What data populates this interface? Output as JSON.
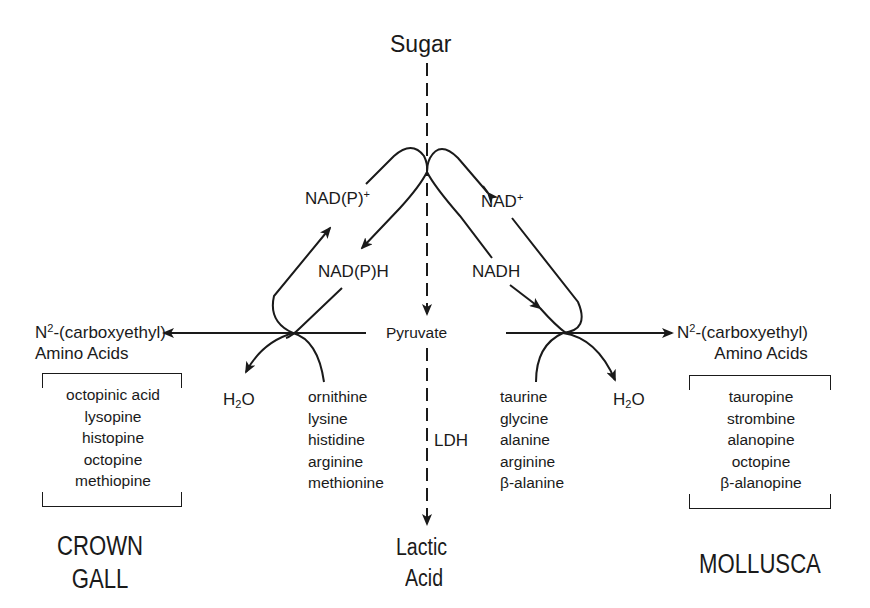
{
  "diagram": {
    "title_nodes": {
      "sugar": "Sugar",
      "pyruvate": "Pyruvate",
      "lactic_acid_line1": "Lactic",
      "lactic_acid_line2": "Acid",
      "ldh": "LDH"
    },
    "cofactors": {
      "left_oxidized_base": "NAD(P)",
      "left_oxidized_sup": "+",
      "left_reduced": "NAD(P)H",
      "right_oxidized_base": "NAD",
      "right_oxidized_sup": "+",
      "right_reduced": "NADH"
    },
    "products": {
      "left_line1_base": "N",
      "left_line1_sup": "2",
      "left_line1_rest": "-(carboxyethyl)",
      "left_line2": "Amino Acids",
      "right_line1_base": "N",
      "right_line1_sup": "2",
      "right_line1_rest": "-(carboxyethyl)",
      "right_line2": "Amino Acids"
    },
    "water": {
      "left_h": "H",
      "left_sub": "2",
      "left_o": "O",
      "right_h": "H",
      "right_sub": "2",
      "right_o": "O"
    },
    "crown_gall_amino_acids": [
      "ornithine",
      "lysine",
      "histidine",
      "arginine",
      "methionine"
    ],
    "mollusca_amino_acids": [
      "taurine",
      "glycine",
      "alanine",
      "arginine",
      "β-alanine"
    ],
    "crown_gall_opines": [
      "octopinic acid",
      "lysopine",
      "histopine",
      "octopine",
      "methiopine"
    ],
    "mollusca_opines": [
      "tauropine",
      "strombine",
      "alanopine",
      "octopine",
      "β-alanopine"
    ],
    "group_labels": {
      "crown_gall_line1": "CROWN",
      "crown_gall_line2": "GALL",
      "mollusca": "MOLLUSCA"
    },
    "colors": {
      "ink": "#1a1a1a",
      "background": "#ffffff"
    }
  }
}
